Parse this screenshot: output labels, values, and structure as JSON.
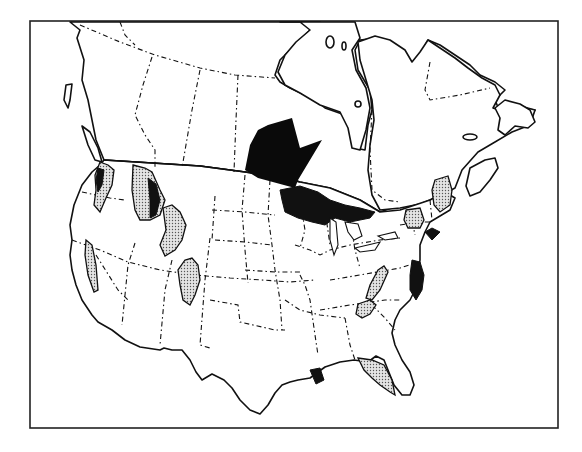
{
  "map": {
    "title": "",
    "region": "North America (United States and Canada)",
    "colors": {
      "background": "#ffffff",
      "land": "#ffffff",
      "outline": "#111111",
      "stipple_fill": "#bdbdbd",
      "highlight_fill": "#0a0a0a"
    },
    "legend": [],
    "features": [
      {
        "name": "pointer-arrow",
        "kind": "arrow",
        "direction": "down-right",
        "target": "Great Lakes region"
      },
      {
        "name": "great-lakes-highlight",
        "kind": "solid-area",
        "region": "Great Lakes / upper Midwest"
      },
      {
        "name": "chesapeake-highlight",
        "kind": "solid-area",
        "region": "Mid-Atlantic coast"
      },
      {
        "name": "cascades-stipple",
        "kind": "stippled-area",
        "region": "Pacific Northwest / Cascades"
      },
      {
        "name": "sierra-stipple",
        "kind": "stippled-area",
        "region": "Sierra Nevada"
      },
      {
        "name": "northern-rockies-stipple",
        "kind": "stippled-area",
        "region": "Northern Rockies"
      },
      {
        "name": "central-rockies-stipple",
        "kind": "stippled-area",
        "region": "Wyoming / Utah ranges"
      },
      {
        "name": "colorado-rockies-stipple",
        "kind": "stippled-area",
        "region": "Colorado Rockies"
      },
      {
        "name": "appalachian-stipple",
        "kind": "stippled-area",
        "region": "Appalachians (Virginia)"
      },
      {
        "name": "smoky-mountains-stipple",
        "kind": "stippled-area",
        "region": "Southern Appalachians"
      },
      {
        "name": "new-york-stipple",
        "kind": "stippled-area",
        "region": "Adirondacks / New York"
      },
      {
        "name": "maine-stipple",
        "kind": "stippled-area",
        "region": "Maine / northern New England"
      },
      {
        "name": "florida-stipple",
        "kind": "stippled-area",
        "region": "Florida"
      }
    ]
  }
}
